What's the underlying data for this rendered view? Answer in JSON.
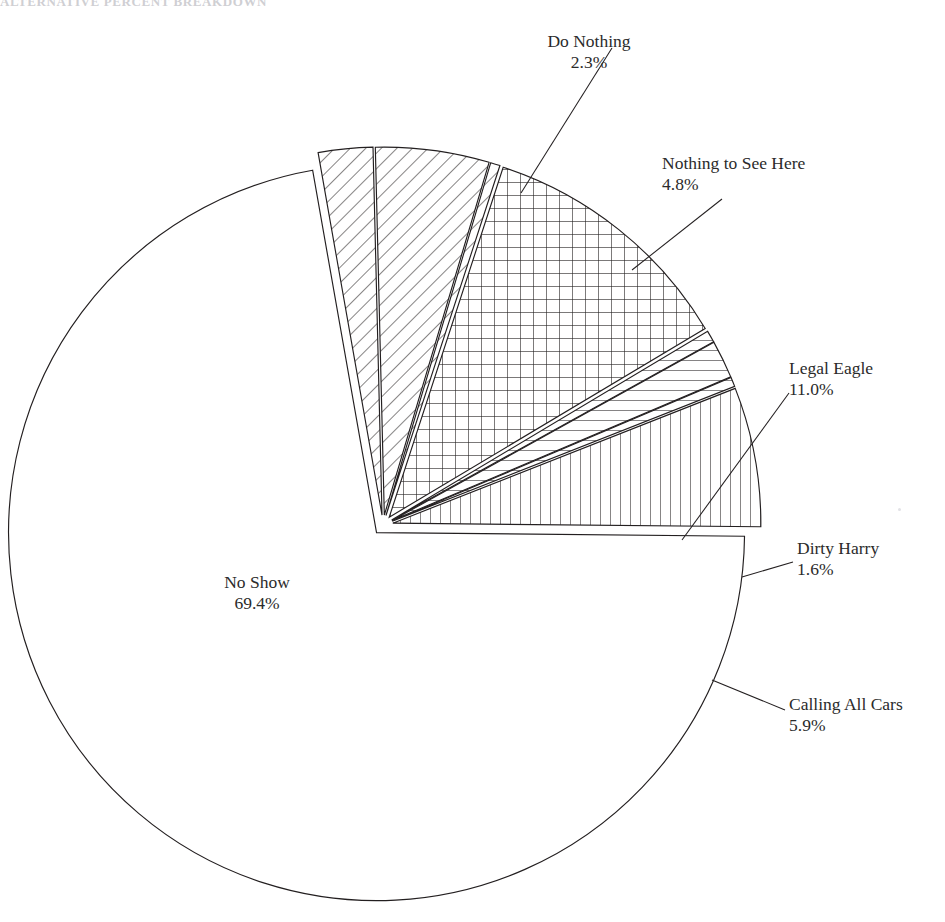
{
  "chart": {
    "title": "ALTERNATIVE PERCENT BREAKDOWN",
    "center_x": 383,
    "center_y": 525,
    "radius": 368
  },
  "chart_data": {
    "type": "pie",
    "title": "ALTERNATIVE PERCENT BREAKDOWN",
    "xlabel": "",
    "ylabel": "",
    "legend_position": "none",
    "labels_show_percent": true,
    "total_labeled_percent": 95.0,
    "categories": [
      "Do Nothing",
      "Nothing to See Here",
      "Legal Eagle",
      "Dirty Harry",
      "Calling All Cars",
      "No Show"
    ],
    "values": [
      2.3,
      4.8,
      11.0,
      1.6,
      5.9,
      69.4
    ],
    "slices": [
      {
        "name": "Do Nothing",
        "label": "Do Nothing",
        "percent": 2.3,
        "percent_text": "2.3%",
        "fill": "diagonal-hatch",
        "exploded": true
      },
      {
        "name": "Nothing to See Here",
        "label": "Nothing to See Here",
        "percent": 4.8,
        "percent_text": "4.8%",
        "fill": "diagonal-hatch",
        "exploded": true
      },
      {
        "name": "Unlabeled Sliver A",
        "label": "",
        "percent": 0.4,
        "percent_text": "",
        "fill": "diagonal-hatch",
        "exploded": true
      },
      {
        "name": "Legal Eagle",
        "label": "Legal Eagle",
        "percent": 11.0,
        "percent_text": "11.0%",
        "fill": "grid-hatch",
        "exploded": true
      },
      {
        "name": "Unlabeled Sliver B",
        "label": "",
        "percent": 0.5,
        "percent_text": "",
        "fill": "horizontal-hatch",
        "exploded": true
      },
      {
        "name": "Dirty Harry",
        "label": "Dirty Harry",
        "percent": 1.6,
        "percent_text": "1.6%",
        "fill": "horizontal-hatch",
        "exploded": true
      },
      {
        "name": "Unlabeled Sliver C",
        "label": "",
        "percent": 0.4,
        "percent_text": "",
        "fill": "horizontal-hatch",
        "exploded": true
      },
      {
        "name": "Calling All Cars",
        "label": "Calling All Cars",
        "percent": 5.9,
        "percent_text": "5.9%",
        "fill": "vertical-hatch",
        "exploded": true
      },
      {
        "name": "No Show",
        "label": "No Show",
        "percent": 69.4,
        "percent_text": "69.4%",
        "fill": "none",
        "exploded": true
      }
    ],
    "colors": {
      "stroke": "#231f20",
      "background": "#ffffff",
      "text": "#2b2b2b"
    }
  },
  "labels": {
    "do_nothing": {
      "name": "Do Nothing",
      "percent": "2.3%"
    },
    "nothing_to_see_here": {
      "name": "Nothing to See Here",
      "percent": "4.8%"
    },
    "legal_eagle": {
      "name": "Legal Eagle",
      "percent": "11.0%"
    },
    "dirty_harry": {
      "name": "Dirty Harry",
      "percent": "1.6%"
    },
    "calling_all_cars": {
      "name": "Calling All Cars",
      "percent": "5.9%"
    },
    "no_show": {
      "name": "No Show",
      "percent": "69.4%"
    }
  }
}
